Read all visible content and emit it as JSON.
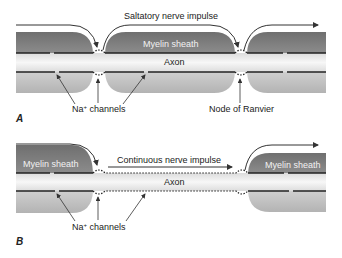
{
  "figure": {
    "panel_a": {
      "letter": "A",
      "impulse_label": "Saltatory nerve impulse",
      "sheath_label": "Myelin sheath",
      "axon_label": "Axon",
      "channels_label_prefix": "Na",
      "channels_label_sup": "+",
      "channels_label_suffix": " channels",
      "node_label": "Node of Ranvier"
    },
    "panel_b": {
      "letter": "B",
      "impulse_label": "Continuous nerve impulse",
      "sheath_label_left": "Myelin sheath",
      "sheath_label_right": "Myelin sheath",
      "axon_label": "Axon",
      "channels_label_prefix": "Na",
      "channels_label_sup": "+",
      "channels_label_suffix": " channels"
    },
    "colors": {
      "sheath_dark": "#7a7a7a",
      "sheath_light": "#bdbdbd",
      "axon": "#efefef",
      "line": "#222222"
    }
  }
}
